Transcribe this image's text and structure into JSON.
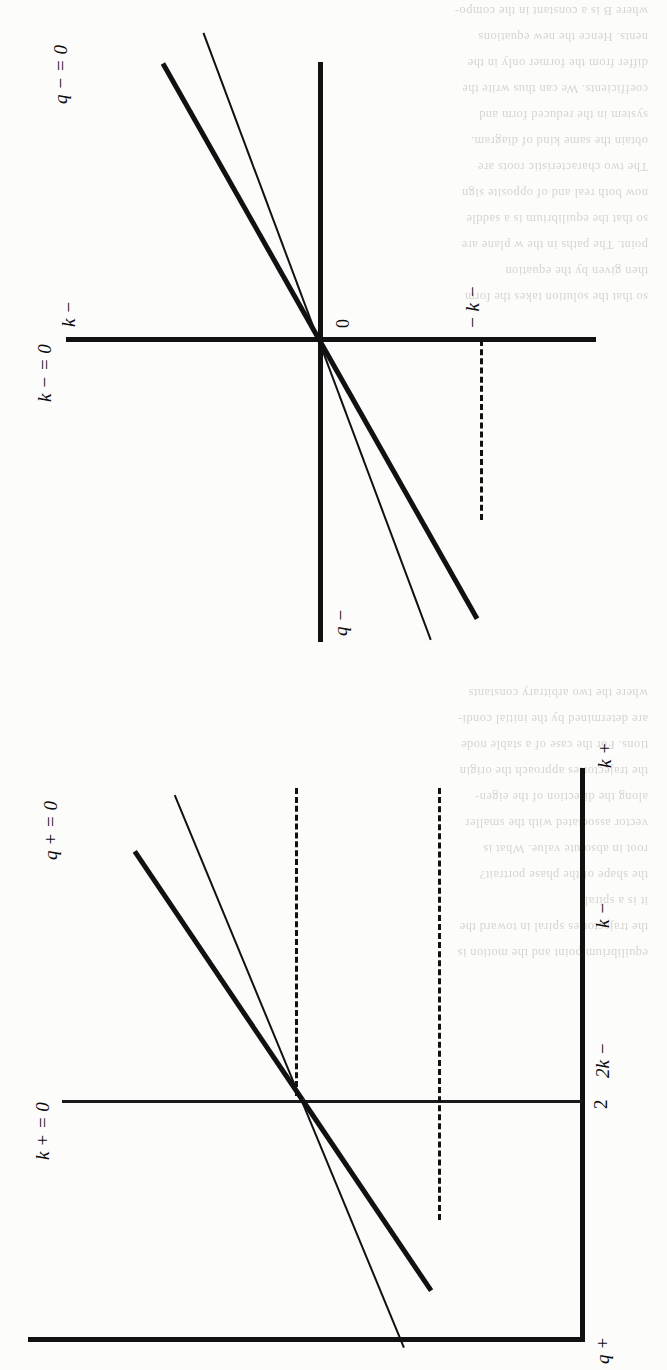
{
  "page": {
    "kind": "scanned-book-page",
    "orientation": "figures rotated 90 degrees counter-clockwise on the scan",
    "background_color": "#fcfcfa",
    "ink_color": "#111111"
  },
  "ghost_text": {
    "note": "faint show-through text from the reverse side of the scanned page",
    "lines": [
      "where  B   is a constant  in the compo-",
      "nents.  Hence  the  new  equations",
      "differ  from  the  former  only  in the",
      "coefficients.  We  can  thus  write  the",
      "system  in  the  reduced  form  and",
      "obtain  the  same  kind  of  diagram.",
      "The  two  characteristic  roots  are",
      "now  both  real  and  of  opposite  sign",
      "so  that  the  equilibrium  is  a  saddle",
      "point.  The  paths  in  the  w  plane  are",
      "then  given  by  the  equation",
      "so  that  the  solution  takes  the  form",
      "where  the  two  arbitrary  constants",
      "are  determined  by  the  initial  condi-",
      "tions.  For  the  case  of  a  stable  node",
      "the  trajectories  approach  the  origin",
      "along  the  direction  of  the  eigen-",
      "vector  associated  with  the  smaller",
      "root  in  absolute  value.  What  is",
      "the  shape  of  the  phase  portrait?",
      "it  is  a  spiral",
      "the  trajectories  spiral  in  toward  the",
      "equilibrium  point  and  the  motion  is",
      "oscillatory  with  damped  amplitude."
    ]
  },
  "figures": [
    {
      "id": "fig-minus",
      "name": "phase-diagram-minus",
      "description": "Four-quadrant phase diagram for the negative regime with two rays through the origin and a dashed projection line.",
      "axes": {
        "horizontal": {
          "label": "q −",
          "label_position": "left-end"
        },
        "vertical": {
          "label": "k −",
          "label_position": "top",
          "isocline_label": "k − = 0"
        }
      },
      "origin_label": "0",
      "labels": {
        "k_nullcline": "k − = 0",
        "q_nullcline": "q − = 0",
        "k_axis": "k −",
        "q_axis": "q −",
        "origin": "0",
        "tick_negative_k": "− k −"
      },
      "rays": [
        {
          "name": "steep-ray-thick",
          "weight": "thick",
          "slope_deg": -30,
          "extends": "both-directions"
        },
        {
          "name": "shallow-ray-thin",
          "weight": "thin",
          "slope_deg": -20,
          "extends": "both-directions"
        }
      ],
      "dashed_lines": [
        {
          "name": "neg-k-projection",
          "from": "thick ray in third quadrant",
          "to": "vertical axis",
          "tick_label": "− k −"
        }
      ]
    },
    {
      "id": "fig-plus",
      "name": "phase-diagram-plus",
      "description": "Phase diagram for the positive regime drawn inside an L-shaped frame with two rays through an interior point and two dashed projection lines to the right-hand axis.",
      "axes": {
        "horizontal": {
          "label": "q +",
          "label_position": "left-end"
        },
        "vertical": {
          "label": "k +",
          "label_position": "right-end"
        }
      },
      "labels": {
        "k_nullcline": "k + = 0",
        "q_nullcline": "q + = 0",
        "k_axis": "k +",
        "q_axis": "q +",
        "tick_two": "2",
        "tick_2k": "2k −",
        "tick_k": "k −"
      },
      "rays": [
        {
          "name": "steep-ray-thick",
          "weight": "thick",
          "slope_deg": -34,
          "extends": "both-directions"
        },
        {
          "name": "shallow-ray-thin",
          "weight": "thin",
          "slope_deg": -22,
          "extends": "both-directions"
        }
      ],
      "dashed_lines": [
        {
          "name": "2k-projection",
          "tick_label": "2k −"
        },
        {
          "name": "k-projection",
          "tick_label": "k −"
        }
      ],
      "ticks": [
        "2",
        "2k −",
        "k −"
      ]
    }
  ],
  "chart_data": {
    "type": "line",
    "title": "",
    "subtitle": "",
    "charts": [
      {
        "name": "phase-diagram-minus",
        "xlabel": "k −",
        "ylabel": "q −",
        "grid": false,
        "legend": "none",
        "xlim": [
          -1.0,
          1.0
        ],
        "ylim": [
          -1.0,
          1.0
        ],
        "annotations": [
          "k − = 0",
          "q − = 0",
          "0",
          "− k −"
        ],
        "series": [
          {
            "name": "k − = 0 nullcline (vertical axis)",
            "x": [
              0,
              0
            ],
            "y": [
              -1.0,
              0.78
            ]
          },
          {
            "name": "q − = 0 nullcline (horizontal axis)",
            "x": [
              -1.0,
              1.0
            ],
            "y": [
              0,
              0
            ]
          },
          {
            "name": "steep saddle path (thick)",
            "x": [
              -0.72,
              0.72
            ],
            "y": [
              -0.42,
              0.42
            ],
            "slope": 0.58
          },
          {
            "name": "shallow saddle path (thin)",
            "x": [
              -0.88,
              0.95
            ],
            "y": [
              -0.32,
              0.35
            ],
            "slope": 0.37
          }
        ]
      },
      {
        "name": "phase-diagram-plus",
        "xlabel": "k +",
        "ylabel": "q +",
        "grid": false,
        "legend": "none",
        "xlim": [
          0,
          1.0
        ],
        "ylim": [
          0,
          1.0
        ],
        "annotations": [
          "k + = 0",
          "q + = 0",
          "2",
          "2k −",
          "k −"
        ],
        "ticks_x": [
          "k −",
          "2k −"
        ],
        "ticks_y": [
          "2"
        ],
        "series": [
          {
            "name": "k + = 0 nullcline (vertical line at q+ = 2)",
            "x": [
              0.42,
              0.42
            ],
            "y": [
              0.0,
              0.92
            ]
          },
          {
            "name": "steep saddle path (thick)",
            "x": [
              0.12,
              0.86
            ],
            "y": [
              0.05,
              0.88
            ],
            "slope": 1.12
          },
          {
            "name": "shallow saddle path (thin)",
            "x": [
              0.06,
              0.96
            ],
            "y": [
              0.08,
              0.8
            ],
            "slope": 0.8
          },
          {
            "name": "dashed projection at 2k −",
            "x": [
              0.42,
              1.0
            ],
            "y": [
              0.56,
              0.56
            ]
          },
          {
            "name": "dashed projection at k −",
            "x": [
              0.2,
              1.0
            ],
            "y": [
              0.22,
              0.22
            ]
          }
        ]
      }
    ]
  }
}
